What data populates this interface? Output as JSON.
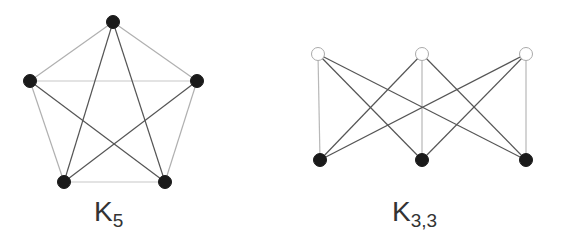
{
  "graphs": [
    {
      "id": "k5",
      "label_main": "K",
      "label_sub": "5",
      "nodes": [
        {
          "x": 113,
          "y": 22,
          "fill": "#1a1a1a"
        },
        {
          "x": 30,
          "y": 81,
          "fill": "#1a1a1a"
        },
        {
          "x": 197,
          "y": 81,
          "fill": "#1a1a1a"
        },
        {
          "x": 64,
          "y": 182,
          "fill": "#1a1a1a"
        },
        {
          "x": 165,
          "y": 182,
          "fill": "#1a1a1a"
        }
      ],
      "edges": [
        {
          "a": 0,
          "b": 1,
          "color": "#b0b0b0"
        },
        {
          "a": 0,
          "b": 2,
          "color": "#b0b0b0"
        },
        {
          "a": 1,
          "b": 3,
          "color": "#b0b0b0"
        },
        {
          "a": 2,
          "b": 4,
          "color": "#b0b0b0"
        },
        {
          "a": 3,
          "b": 4,
          "color": "#c8c8c8"
        },
        {
          "a": 1,
          "b": 2,
          "color": "#c8c8c8"
        },
        {
          "a": 0,
          "b": 3,
          "color": "#555555"
        },
        {
          "a": 0,
          "b": 4,
          "color": "#555555"
        },
        {
          "a": 1,
          "b": 4,
          "color": "#555555"
        },
        {
          "a": 2,
          "b": 3,
          "color": "#555555"
        }
      ]
    },
    {
      "id": "k33",
      "label_main": "K",
      "label_sub": "3,3",
      "nodes": [
        {
          "x": 318,
          "y": 54,
          "fill": "#ffffff"
        },
        {
          "x": 422,
          "y": 54,
          "fill": "#ffffff"
        },
        {
          "x": 526,
          "y": 54,
          "fill": "#ffffff"
        },
        {
          "x": 320,
          "y": 160,
          "fill": "#1a1a1a"
        },
        {
          "x": 422,
          "y": 160,
          "fill": "#1a1a1a"
        },
        {
          "x": 526,
          "y": 160,
          "fill": "#1a1a1a"
        }
      ],
      "edges": [
        {
          "a": 0,
          "b": 3,
          "color": "#b8b8b8"
        },
        {
          "a": 1,
          "b": 4,
          "color": "#b8b8b8"
        },
        {
          "a": 2,
          "b": 5,
          "color": "#b8b8b8"
        },
        {
          "a": 0,
          "b": 4,
          "color": "#555555"
        },
        {
          "a": 0,
          "b": 5,
          "color": "#555555"
        },
        {
          "a": 1,
          "b": 3,
          "color": "#555555"
        },
        {
          "a": 1,
          "b": 5,
          "color": "#555555"
        },
        {
          "a": 2,
          "b": 3,
          "color": "#555555"
        },
        {
          "a": 2,
          "b": 4,
          "color": "#555555"
        }
      ]
    }
  ],
  "labels": {
    "k5_main": "K",
    "k5_sub": "5",
    "k33_main": "K",
    "k33_sub": "3,3"
  }
}
